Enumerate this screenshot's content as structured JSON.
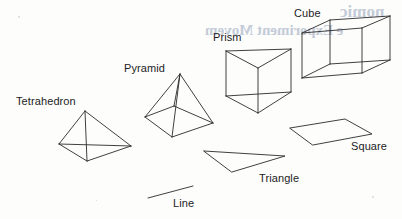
{
  "figure": {
    "background_color": "#fdfdfc",
    "stroke_color": "#2a2a2a",
    "label_color": "#1c1c1c",
    "bleed_color": "#b9c3d2"
  },
  "labels": {
    "tetrahedron": "Tetrahedron",
    "pyramid": "Pyramid",
    "prism": "Prism",
    "cube": "Cube",
    "square": "Square",
    "triangle": "Triangle",
    "line": "Line"
  },
  "bleed_text": {
    "line1": "nomic",
    "line2": "e Experiment Movem"
  },
  "shapes": {
    "line": {
      "name": "Line",
      "type": "segment",
      "points": [
        [
          148,
          198
        ],
        [
          193,
          186
        ]
      ]
    },
    "triangle": {
      "name": "Triangle",
      "type": "polygon",
      "points": [
        [
          204,
          151
        ],
        [
          285,
          156
        ],
        [
          232,
          172
        ]
      ]
    },
    "square": {
      "name": "Square",
      "type": "polygon",
      "points": [
        [
          290,
          128
        ],
        [
          345,
          119
        ],
        [
          372,
          134
        ],
        [
          313,
          145
        ]
      ]
    },
    "tetrahedron": {
      "name": "Tetrahedron",
      "type": "wireframe",
      "vertices": {
        "apex": [
          85,
          111
        ],
        "left": [
          59,
          144
        ],
        "right": [
          131,
          146
        ],
        "front": [
          87,
          161
        ]
      },
      "edges": [
        [
          "apex",
          "left"
        ],
        [
          "apex",
          "right"
        ],
        [
          "apex",
          "front"
        ],
        [
          "left",
          "right"
        ],
        [
          "left",
          "front"
        ],
        [
          "right",
          "front"
        ]
      ]
    },
    "pyramid": {
      "name": "Pyramid",
      "type": "wireframe",
      "vertices": {
        "apex": [
          180,
          74
        ],
        "base_left": [
          145,
          117
        ],
        "base_back": [
          174,
          106
        ],
        "base_right": [
          213,
          123
        ],
        "base_front": [
          172,
          137
        ]
      },
      "edges": [
        [
          "apex",
          "base_left"
        ],
        [
          "apex",
          "base_back"
        ],
        [
          "apex",
          "base_right"
        ],
        [
          "apex",
          "base_front"
        ],
        [
          "base_left",
          "base_back"
        ],
        [
          "base_back",
          "base_right"
        ],
        [
          "base_right",
          "base_front"
        ],
        [
          "base_front",
          "base_left"
        ]
      ]
    },
    "prism": {
      "name": "Prism",
      "type": "wireframe",
      "vertices": {
        "top_left": [
          226,
          51
        ],
        "top_right": [
          291,
          49
        ],
        "top_front": [
          258,
          68
        ],
        "bottom_left": [
          226,
          96
        ],
        "bottom_right": [
          291,
          92
        ],
        "bottom_front": [
          258,
          113
        ]
      },
      "edges": [
        [
          "top_left",
          "top_right"
        ],
        [
          "top_right",
          "top_front"
        ],
        [
          "top_front",
          "top_left"
        ],
        [
          "bottom_left",
          "bottom_right"
        ],
        [
          "bottom_right",
          "bottom_front"
        ],
        [
          "bottom_front",
          "bottom_left"
        ],
        [
          "top_left",
          "bottom_left"
        ],
        [
          "top_right",
          "bottom_right"
        ],
        [
          "top_front",
          "bottom_front"
        ]
      ]
    },
    "cube": {
      "name": "Cube",
      "type": "wireframe",
      "vertices": {
        "front_tl": [
          302,
          33
        ],
        "front_tr": [
          362,
          28
        ],
        "front_br": [
          362,
          73
        ],
        "front_bl": [
          302,
          78
        ],
        "back_tl": [
          330,
          20
        ],
        "back_tr": [
          390,
          16
        ],
        "back_br": [
          390,
          60
        ],
        "back_bl": [
          330,
          64
        ]
      },
      "edges": [
        [
          "front_tl",
          "front_tr"
        ],
        [
          "front_tr",
          "front_br"
        ],
        [
          "front_br",
          "front_bl"
        ],
        [
          "front_bl",
          "front_tl"
        ],
        [
          "back_tl",
          "back_tr"
        ],
        [
          "back_tr",
          "back_br"
        ],
        [
          "back_br",
          "back_bl"
        ],
        [
          "back_bl",
          "back_tl"
        ],
        [
          "front_tl",
          "back_tl"
        ],
        [
          "front_tr",
          "back_tr"
        ],
        [
          "front_br",
          "back_br"
        ],
        [
          "front_bl",
          "back_bl"
        ]
      ]
    }
  }
}
